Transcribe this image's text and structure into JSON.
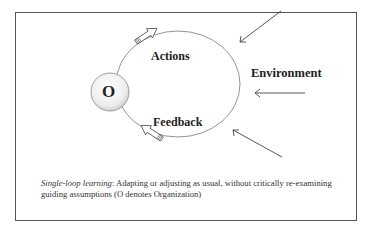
{
  "diagram": {
    "center_node": {
      "label": "O",
      "meaning": "Organization"
    },
    "loop_labels": {
      "actions": "Actions",
      "feedback": "Feedback"
    },
    "environment_label": "Environment",
    "environment_arrows": 3
  },
  "caption": {
    "term": "Single-loop learning",
    "separator": ":",
    "text": " Adapting or adjusting as usual, without critically re-examining guiding assumptions (O denotes Organization)"
  }
}
